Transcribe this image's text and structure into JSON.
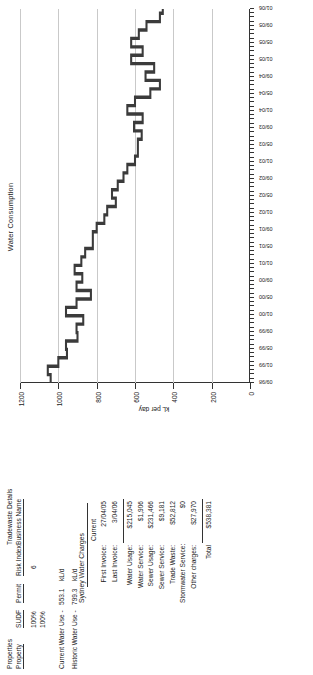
{
  "report": {
    "properties_heading": "Properties",
    "tradewaste_heading": "Tradewaste Details",
    "columns": {
      "property": "Property",
      "sudf": "SUDF",
      "permit": "Permit",
      "risk_index": "Risk Index",
      "business_name": "Business Name"
    },
    "property_rows": [
      {
        "property": "",
        "sudf": "100%",
        "permit": "",
        "risk_index": "6",
        "business_name": ""
      },
      {
        "property": "",
        "sudf": "100%",
        "permit": "",
        "risk_index": "",
        "business_name": ""
      }
    ],
    "water_use": [
      {
        "label": "Current Water Use -",
        "value": "553.1",
        "unit": "kL/d"
      },
      {
        "label": "Historic Water Use -",
        "value": "799.3",
        "unit": "kL/d"
      }
    ]
  },
  "charges": {
    "title": "Sydney Water Charges",
    "column_header": "Current",
    "invoices": [
      {
        "label": "First Invoice:",
        "value": "27/04/05"
      },
      {
        "label": "Last Invoice:",
        "value": "3/04/06"
      }
    ],
    "items": [
      {
        "label": "Water Usage:",
        "value": "$215,045"
      },
      {
        "label": "Water Service:",
        "value": "$1,906"
      },
      {
        "label": "Sewer Usage:",
        "value": "$231,466"
      },
      {
        "label": "Sewer Service:",
        "value": "$9,181"
      },
      {
        "label": "Trade Waste:",
        "value": "$52,812"
      },
      {
        "label": "Stormwater Service:",
        "value": "$0"
      },
      {
        "label": "Other charges:",
        "value": "$27,970"
      }
    ],
    "total": {
      "label": "Total",
      "value": "$538,381"
    }
  },
  "chart_data": {
    "type": "line",
    "title": "Water Consumption",
    "xlabel": "",
    "ylabel": "kL per day",
    "ylim": [
      0,
      1200
    ],
    "yticks": [
      0,
      200,
      400,
      600,
      800,
      1000,
      1200
    ],
    "grid": true,
    "legend": "none",
    "line_style": "step",
    "x_tick_labels": [
      "09/98",
      "01/99",
      "05/99",
      "09/99",
      "01/00",
      "05/00",
      "09/00",
      "01/01",
      "05/01",
      "09/01",
      "01/02",
      "05/02",
      "09/02",
      "01/03",
      "05/03",
      "09/03",
      "01/04",
      "05/04",
      "09/04",
      "01/05",
      "05/05",
      "09/05",
      "01/06"
    ],
    "x": [
      "09/98",
      "10/98",
      "11/98",
      "12/98",
      "01/99",
      "02/99",
      "03/99",
      "04/99",
      "05/99",
      "06/99",
      "07/99",
      "08/99",
      "09/99",
      "10/99",
      "11/99",
      "12/99",
      "01/00",
      "02/00",
      "03/00",
      "04/00",
      "05/00",
      "06/00",
      "07/00",
      "08/00",
      "09/00",
      "10/00",
      "11/00",
      "12/00",
      "01/01",
      "02/01",
      "03/01",
      "04/01",
      "05/01",
      "06/01",
      "07/01",
      "08/01",
      "09/01",
      "10/01",
      "11/01",
      "12/01",
      "01/02",
      "02/02",
      "03/02",
      "04/02",
      "05/02",
      "06/02",
      "07/02",
      "08/02",
      "09/02",
      "10/02",
      "11/02",
      "12/02",
      "01/03",
      "02/03",
      "03/03",
      "04/03",
      "05/03",
      "06/03",
      "07/03",
      "08/03",
      "09/03",
      "10/03",
      "11/03",
      "12/03",
      "01/04",
      "02/04",
      "03/04",
      "04/04",
      "05/04",
      "06/04",
      "07/04",
      "08/04",
      "09/04",
      "10/04",
      "11/04",
      "12/04",
      "01/05",
      "02/05",
      "03/05",
      "04/05",
      "05/05",
      "06/05",
      "07/05",
      "08/05",
      "09/05",
      "10/05",
      "11/05",
      "12/05",
      "01/06"
    ],
    "values": [
      1040,
      1040,
      1055,
      1055,
      1000,
      1000,
      955,
      955,
      960,
      960,
      900,
      900,
      905,
      905,
      870,
      870,
      960,
      960,
      905,
      905,
      830,
      830,
      905,
      905,
      875,
      875,
      915,
      915,
      880,
      880,
      860,
      860,
      820,
      820,
      820,
      820,
      800,
      800,
      760,
      760,
      745,
      745,
      700,
      700,
      720,
      720,
      690,
      690,
      660,
      660,
      640,
      640,
      600,
      600,
      585,
      585,
      585,
      585,
      565,
      565,
      605,
      605,
      560,
      560,
      640,
      640,
      600,
      600,
      520,
      520,
      470,
      470,
      545,
      545,
      500,
      500,
      620,
      620,
      560,
      560,
      620,
      620,
      580,
      580,
      540,
      540,
      470,
      470,
      455
    ]
  }
}
